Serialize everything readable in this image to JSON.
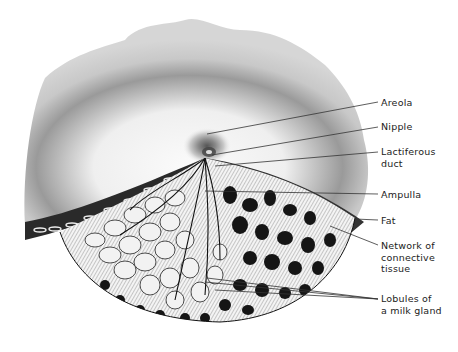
{
  "figure": {
    "colors": {
      "skin_light": "#f2f2f2",
      "skin_mid": "#bdbdbd",
      "skin_dark": "#4a4a4a",
      "ink": "#111111",
      "gland": "#e9e9e9",
      "leader_line": "#333333"
    }
  },
  "labels": [
    {
      "id": "areola",
      "text": "Areola",
      "y": 97,
      "target": [
        207,
        134
      ]
    },
    {
      "id": "nipple",
      "text": "Nipple",
      "y": 121,
      "target": [
        212,
        155
      ]
    },
    {
      "id": "lactiferous-duct",
      "text": "Lactiferous\nduct",
      "y": 146,
      "target": [
        215,
        166
      ]
    },
    {
      "id": "ampulla",
      "text": "Ampulla",
      "y": 189,
      "target": [
        205,
        191
      ]
    },
    {
      "id": "fat",
      "text": "Fat",
      "y": 215,
      "target": [
        355,
        219
      ]
    },
    {
      "id": "network-connective-tissue",
      "text": "Network of\nconnective\ntissue",
      "y": 240,
      "target": [
        330,
        226
      ]
    },
    {
      "id": "lobules-milk-gland",
      "text": "Lobules of\na milk gland",
      "y": 293,
      "targets": [
        [
          207,
          278
        ],
        [
          205,
          282
        ],
        [
          215,
          290
        ]
      ]
    }
  ]
}
